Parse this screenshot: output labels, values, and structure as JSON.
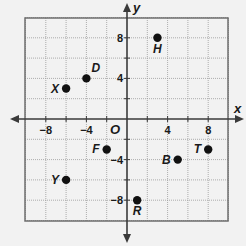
{
  "diagram": {
    "type": "coordinate-plane",
    "axes": {
      "x_label": "x",
      "y_label": "y",
      "origin_label": "O",
      "range": [
        -10,
        10
      ],
      "grid_step": 2,
      "x_ticks": [
        {
          "value": -8,
          "label": "−8"
        },
        {
          "value": -4,
          "label": "−4"
        },
        {
          "value": 4,
          "label": "4"
        },
        {
          "value": 8,
          "label": "8"
        }
      ],
      "y_ticks": [
        {
          "value": 8,
          "label": "8"
        },
        {
          "value": 4,
          "label": "4"
        },
        {
          "value": -4,
          "label": "−4"
        },
        {
          "value": -8,
          "label": "−8"
        }
      ]
    },
    "points": [
      {
        "name": "H",
        "x": 3,
        "y": 8,
        "label_pos": "below"
      },
      {
        "name": "D",
        "x": -4,
        "y": 4,
        "label_pos": "upper-right"
      },
      {
        "name": "X",
        "x": -6,
        "y": 3,
        "label_pos": "left"
      },
      {
        "name": "F",
        "x": -2,
        "y": -3,
        "label_pos": "left"
      },
      {
        "name": "Y",
        "x": -6,
        "y": -6,
        "label_pos": "left"
      },
      {
        "name": "B",
        "x": 5,
        "y": -4,
        "label_pos": "left"
      },
      {
        "name": "T",
        "x": 8,
        "y": -3,
        "label_pos": "left"
      },
      {
        "name": "R",
        "x": 1,
        "y": -8,
        "label_pos": "below"
      }
    ],
    "colors": {
      "background": "#f2f2f2",
      "frame": "#6e6e6e",
      "grid": "#9a9a9a",
      "axis": "#3a3a3a",
      "point": "#111111",
      "text": "#1a1a1a"
    }
  }
}
